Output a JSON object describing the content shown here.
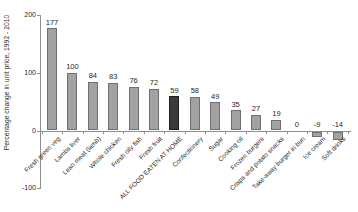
{
  "chart_data": {
    "type": "bar",
    "title": "",
    "xlabel": "",
    "ylabel": "Percentage change in unit price, 1992 - 2010",
    "ylim": [
      -100,
      200
    ],
    "yticks": [
      200,
      100,
      0,
      -100
    ],
    "grid": false,
    "legend_position": "none",
    "categories": [
      "Fresh green veg",
      "Lambs liver",
      "Lean meat (lamb)",
      "Whole chicken",
      "Fresh oily fish",
      "Fresh fruit",
      "ALL FOOD EATEN AT HOME",
      "Confectionery",
      "Sugar",
      "Cooking oil",
      "Frozen burgers",
      "Crisps and potato snacks",
      "Take-away burger in bun",
      "Ice cream",
      "Soft drinks"
    ],
    "values": [
      177,
      100,
      84,
      83,
      76,
      72,
      59,
      58,
      49,
      35,
      27,
      19,
      0,
      -9,
      -14
    ],
    "highlight_index": 6,
    "colors": {
      "bar_fill": "#a2a2a2",
      "bar_border": "#6f6f6f",
      "highlight_fill": "#3b3b3b",
      "highlight_border": "#1c1c1c",
      "axis": "#8f8f8f",
      "text": "#1f1f1f",
      "background": "#ffffff"
    }
  }
}
